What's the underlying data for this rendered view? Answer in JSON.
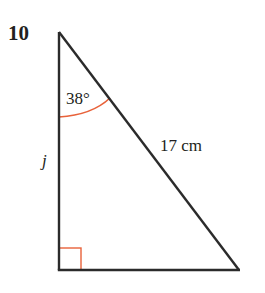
{
  "question": {
    "number": "10"
  },
  "triangle": {
    "type": "right-triangle",
    "vertices": {
      "top": [
        59,
        32
      ],
      "bottom_left": [
        59,
        270
      ],
      "bottom_right": [
        239,
        270
      ]
    },
    "right_angle_at": "bottom_left",
    "stroke_color": "#2b2b2b",
    "marker_color": "#e8623a"
  },
  "labels": {
    "angle": "38°",
    "hypotenuse": "17 cm",
    "vertical_side": "j"
  }
}
